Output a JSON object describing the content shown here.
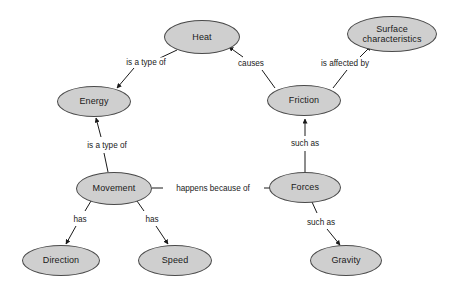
{
  "diagram": {
    "background_color": "#ffffff",
    "node_fill_color": "#cfcfcf",
    "node_border_color": "#4a4a4a",
    "text_color": "#1a1a1a",
    "nodes": [
      {
        "id": "heat",
        "label": "Heat",
        "x": 202,
        "y": 37,
        "w": 76,
        "h": 34
      },
      {
        "id": "surface",
        "label": "Surface characteristics",
        "line1": "Surface",
        "line2": "characteristics",
        "x": 392,
        "y": 34,
        "w": 90,
        "h": 36
      },
      {
        "id": "energy",
        "label": "Energy",
        "x": 94,
        "y": 101,
        "w": 74,
        "h": 31
      },
      {
        "id": "friction",
        "label": "Friction",
        "x": 304,
        "y": 100,
        "w": 74,
        "h": 31
      },
      {
        "id": "movement",
        "label": "Movement",
        "x": 114,
        "y": 188,
        "w": 76,
        "h": 33
      },
      {
        "id": "forces",
        "label": "Forces",
        "x": 305,
        "y": 188,
        "w": 72,
        "h": 31
      },
      {
        "id": "direction",
        "label": "Direction",
        "x": 61,
        "y": 260,
        "w": 78,
        "h": 31
      },
      {
        "id": "speed",
        "label": "Speed",
        "x": 175,
        "y": 260,
        "w": 74,
        "h": 31
      },
      {
        "id": "gravity",
        "label": "Gravity",
        "x": 346,
        "y": 260,
        "w": 72,
        "h": 31
      }
    ],
    "edges": [
      {
        "id": "heat-energy",
        "from": "heat",
        "to": "energy",
        "label": "is a type of",
        "label_x": 146,
        "label_y": 62,
        "arrow": true
      },
      {
        "id": "friction-heat",
        "from": "friction",
        "to": "heat",
        "label": "causes",
        "label_x": 251,
        "label_y": 63,
        "arrow": true
      },
      {
        "id": "friction-surface",
        "from": "friction",
        "to": "surface",
        "label": "is affected by",
        "label_x": 345,
        "label_y": 63,
        "arrow": true
      },
      {
        "id": "movement-energy",
        "from": "movement",
        "to": "energy",
        "label": "is a type of",
        "label_x": 107,
        "label_y": 145,
        "arrow": true
      },
      {
        "id": "forces-friction",
        "from": "forces",
        "to": "friction",
        "label": "such as",
        "label_x": 305,
        "label_y": 143,
        "arrow": true
      },
      {
        "id": "movement-forces",
        "from": "movement",
        "to": "forces",
        "label": "happens because of",
        "label_x": 213,
        "label_y": 188,
        "arrow": true
      },
      {
        "id": "movement-direction",
        "from": "movement",
        "to": "direction",
        "label": "has",
        "label_x": 80,
        "label_y": 219,
        "arrow": true
      },
      {
        "id": "movement-speed",
        "from": "movement",
        "to": "speed",
        "label": "has",
        "label_x": 152,
        "label_y": 219,
        "arrow": true
      },
      {
        "id": "forces-gravity",
        "from": "forces",
        "to": "gravity",
        "label": "such as",
        "label_x": 321,
        "label_y": 222,
        "arrow": true
      }
    ]
  }
}
